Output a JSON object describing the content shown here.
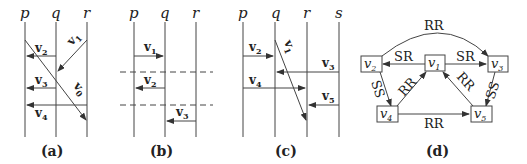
{
  "panels": {
    "a": {
      "caption": "(a)",
      "processes": [
        "p",
        "q",
        "r"
      ],
      "messages": [
        {
          "name": "v",
          "sub": "2",
          "from": "q",
          "to": "p"
        },
        {
          "name": "v",
          "sub": "1",
          "from": "r",
          "to": "q"
        },
        {
          "name": "v",
          "sub": "3",
          "from": "q",
          "to": "p"
        },
        {
          "name": "v",
          "sub": "0",
          "from": "p",
          "to": "r"
        },
        {
          "name": "v",
          "sub": "4",
          "from": "r",
          "to": "p"
        }
      ]
    },
    "b": {
      "caption": "(b)",
      "processes": [
        "p",
        "q",
        "r"
      ],
      "messages": [
        {
          "name": "v",
          "sub": "1",
          "from": "p",
          "to": "q"
        },
        {
          "name": "v",
          "sub": "2",
          "from": "q",
          "to": "p"
        },
        {
          "name": "v",
          "sub": "3",
          "from": "r",
          "to": "q"
        }
      ]
    },
    "c": {
      "caption": "(c)",
      "processes": [
        "p",
        "q",
        "r",
        "s"
      ],
      "messages": [
        {
          "name": "v",
          "sub": "2",
          "from": "p",
          "to": "q"
        },
        {
          "name": "v",
          "sub": "1",
          "from": "q",
          "to": "r"
        },
        {
          "name": "v",
          "sub": "3",
          "from": "s",
          "to": "q"
        },
        {
          "name": "v",
          "sub": "4",
          "from": "p",
          "to": "r"
        },
        {
          "name": "v",
          "sub": "5",
          "from": "s",
          "to": "r"
        }
      ]
    },
    "d": {
      "caption": "(d)",
      "nodes": [
        {
          "id": "v1",
          "name": "v",
          "sub": "1"
        },
        {
          "id": "v2",
          "name": "v",
          "sub": "2"
        },
        {
          "id": "v3",
          "name": "v",
          "sub": "3"
        },
        {
          "id": "v4",
          "name": "v",
          "sub": "4"
        },
        {
          "id": "v5",
          "name": "v",
          "sub": "5"
        }
      ],
      "edges": [
        {
          "from": "v2",
          "to": "v3",
          "label": "RR"
        },
        {
          "from": "v1",
          "to": "v2",
          "label": "SR"
        },
        {
          "from": "v1",
          "to": "v3",
          "label": "SR"
        },
        {
          "from": "v4",
          "to": "v1",
          "label": "RR"
        },
        {
          "from": "v5",
          "to": "v1",
          "label": "RR"
        },
        {
          "from": "v2",
          "to": "v4",
          "label": "SS"
        },
        {
          "from": "v3",
          "to": "v5",
          "label": "SS"
        },
        {
          "from": "v4",
          "to": "v5",
          "label": "RR"
        }
      ]
    }
  }
}
